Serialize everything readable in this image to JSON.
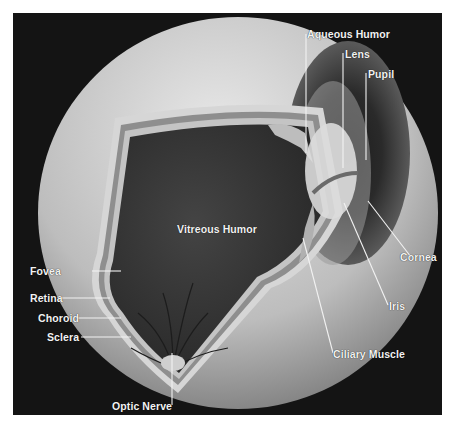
{
  "figure": {
    "labels": {
      "aqueous_humor": "Aqueous Humor",
      "lens": "Lens",
      "pupil": "Pupil",
      "vitreous_humor": "Vitreous Humor",
      "cornea": "Cornea",
      "iris": "Iris",
      "ciliary_muscle": "Ciliary Muscle",
      "fovea": "Fovea",
      "retina": "Retina",
      "choroid": "Choroid",
      "sclera": "Sclera",
      "optic_nerve": "Optic Nerve"
    },
    "colors": {
      "background": "#141414",
      "eyeball": "#cfcfcf",
      "interior": "#3a3a3a",
      "label_text": "#f2f2f2",
      "iris": "#4a4a4a"
    }
  }
}
